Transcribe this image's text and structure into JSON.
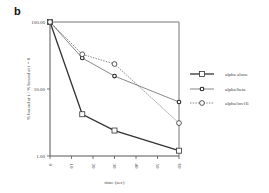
{
  "panel_label": "b",
  "chart_data": {
    "type": "line",
    "title": "",
    "xlabel": "time (sec)",
    "ylabel": "% bound at t / % bound at t = 0",
    "yscale": "log",
    "ylim": [
      1,
      100
    ],
    "xlim": [
      0,
      60
    ],
    "x_ticks": [
      "0",
      "10",
      "20",
      "30",
      "40",
      "50",
      "60"
    ],
    "y_ticks": [
      "1.00",
      "10.00",
      "100.00"
    ],
    "grid": false,
    "legend_position": "right",
    "x": [
      0,
      15,
      30,
      60
    ],
    "series": [
      {
        "name": "alpha alone",
        "marker": "square",
        "line": "solid-thick",
        "values": [
          100,
          4.2,
          2.4,
          1.2
        ]
      },
      {
        "name": "alpha/beta",
        "marker": "diamond-filled",
        "line": "solid-thin",
        "values": [
          100,
          29,
          15.6,
          6.4
        ]
      },
      {
        "name": "alpha/inv16",
        "marker": "circle",
        "line": "dashed",
        "values": [
          100,
          33,
          23.6,
          3.1
        ]
      }
    ]
  }
}
